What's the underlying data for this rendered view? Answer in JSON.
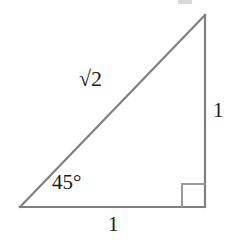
{
  "figure": {
    "name": "right-isosceles-triangle-45-45-90",
    "background_color": "#ffffff",
    "stroke_color": "#808080",
    "text_color": "#1a1a1a",
    "width": 235,
    "height": 240,
    "geometry": {
      "vertices": {
        "left": [
          20,
          207
        ],
        "bottom_right": [
          205,
          207
        ],
        "apex": [
          205,
          15
        ]
      },
      "right_angle_marker": {
        "at_vertex": "bottom_right",
        "size": 23
      }
    },
    "labels": {
      "hypotenuse": "√2",
      "hypotenuse_radicand": "2",
      "angle": "45°",
      "vertical_side": "1",
      "horizontal_side": "1"
    }
  }
}
